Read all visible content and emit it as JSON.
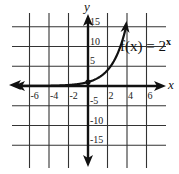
{
  "chart_data": {
    "type": "line",
    "title": "",
    "xlabel": "x",
    "ylabel": "y",
    "xlim": [
      -7,
      7
    ],
    "ylim": [
      -17,
      17
    ],
    "grid": true,
    "x_ticks": [
      -6,
      -4,
      -2,
      2,
      4,
      6
    ],
    "y_ticks": [
      15,
      10,
      5,
      -5,
      -10,
      -15
    ],
    "x_tick_labels": [
      "-6",
      "-4",
      "-2",
      "2",
      "4",
      "6"
    ],
    "y_tick_labels": [
      "15",
      "10",
      "5",
      "-5",
      "-10",
      "-15"
    ],
    "series": [
      {
        "name": "f(x) = 2^x",
        "function": "2^x",
        "x": [
          -7,
          -6,
          -4,
          -2,
          -1,
          0,
          1,
          2,
          3,
          3.5,
          4
        ],
        "values": [
          0.0078,
          0.0156,
          0.0625,
          0.25,
          0.5,
          1,
          2,
          4,
          8,
          11.3,
          16
        ],
        "marked_points": [
          {
            "x": 0,
            "y": 1
          }
        ]
      }
    ],
    "annotations": [
      {
        "text": "f(x) = 2",
        "superscript": "x",
        "position": "right of curve near y=10"
      }
    ]
  },
  "labels": {
    "x_axis": "x",
    "y_axis": "y",
    "function_main": "f(x) = 2",
    "function_exp": "x"
  }
}
